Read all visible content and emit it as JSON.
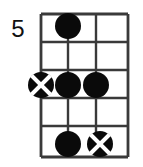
{
  "diagram": {
    "type": "guitar-chord-diagram",
    "fret_number_label": "5",
    "strings_count": 4,
    "frets_count": 5,
    "geometry": {
      "string_x": [
        41,
        68,
        96,
        128
      ],
      "fret_y": [
        14,
        42,
        70,
        98,
        126,
        157
      ],
      "dot_radius": 13,
      "marker_radius": 13
    },
    "colors": {
      "background": "#ffffff",
      "grid": "#3a3a3a",
      "dot": "#0a0a0a",
      "cross": "#ffffff",
      "text": "#111111"
    },
    "markers": [
      {
        "id": "dot-s2-f1",
        "kind": "filled-dot",
        "string": 2,
        "fret": 1,
        "cx": 68,
        "cy": 26,
        "label": ""
      },
      {
        "id": "cross-s1-f3",
        "kind": "crossed-dot",
        "string": 1,
        "fret": 3,
        "cx": 41,
        "cy": 85,
        "label": ""
      },
      {
        "id": "dot-s2-f3",
        "kind": "filled-dot",
        "string": 2,
        "fret": 3,
        "cx": 68,
        "cy": 85,
        "label": ""
      },
      {
        "id": "dot-s3-f3",
        "kind": "filled-dot",
        "string": 3,
        "fret": 3,
        "cx": 96,
        "cy": 85,
        "label": ""
      },
      {
        "id": "dot-s2-f5",
        "kind": "filled-dot",
        "string": 2,
        "fret": 5,
        "cx": 68,
        "cy": 144,
        "label": ""
      },
      {
        "id": "cross-s3-f5",
        "kind": "crossed-dot",
        "string": 3,
        "fret": 5,
        "cx": 100,
        "cy": 144,
        "label": ""
      }
    ]
  }
}
